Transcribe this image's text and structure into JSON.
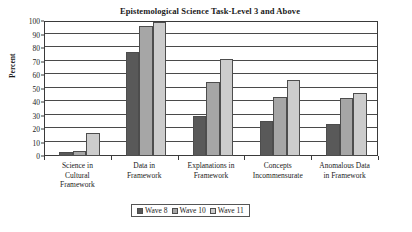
{
  "chart_data": {
    "type": "bar",
    "title": "Epistemological Science Task-Level 3 and Above",
    "xlabel": "",
    "ylabel": "Percent",
    "ylim": [
      0,
      100
    ],
    "ytick_step": 10,
    "yticks": [
      0,
      10,
      20,
      30,
      40,
      50,
      60,
      70,
      80,
      90,
      100
    ],
    "grid": true,
    "legend_position": "bottom",
    "categories": [
      "Science in\nCultural\nFramework",
      "Data in\nFramework",
      "Explanations in\nFramework",
      "Concepts\nIncommensurate",
      "Anomalous Data\nin Framework"
    ],
    "series": [
      {
        "name": "Wave 8",
        "color": "#595959",
        "values": [
          3,
          77,
          30,
          26,
          24
        ]
      },
      {
        "name": "Wave 10",
        "color": "#a6a6a6",
        "values": [
          4,
          96,
          55,
          44,
          43
        ]
      },
      {
        "name": "Wave 11",
        "color": "#cccccc",
        "values": [
          17,
          99,
          72,
          56,
          47
        ]
      }
    ]
  },
  "legend": {
    "entries": [
      {
        "label": "Wave 8"
      },
      {
        "label": "Wave 10"
      },
      {
        "label": "Wave 11"
      }
    ]
  }
}
